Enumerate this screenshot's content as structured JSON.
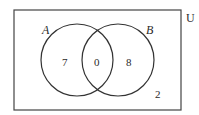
{
  "diagram": {
    "type": "venn",
    "universe_label": "U",
    "sets": [
      {
        "label": "A",
        "only_count": "7"
      },
      {
        "label": "B",
        "only_count": "8"
      }
    ],
    "intersection_count": "0",
    "outside_count": "2"
  }
}
